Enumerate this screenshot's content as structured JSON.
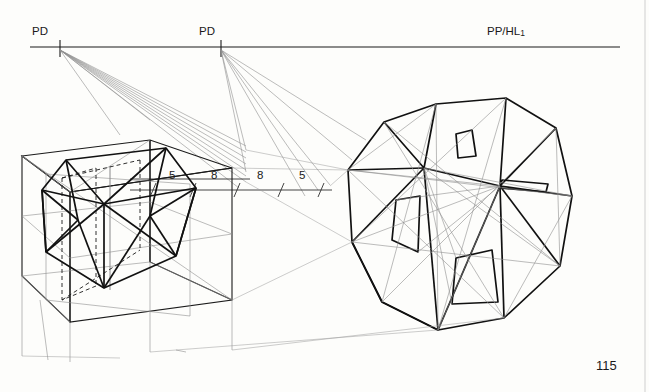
{
  "page": {
    "page_number": "115",
    "background_color": "#fdfdfb",
    "ink_color": "#1a1a1a",
    "construction_color": "#8c8c8c"
  },
  "labels": {
    "pd_left": "PD",
    "pd_right": "PD",
    "picture_plane": "PP/HL",
    "picture_plane_sub": "1",
    "measure_5_left": "5",
    "measure_8_left": "8",
    "measure_8_right": "8",
    "measure_5_right": "5"
  },
  "diagram": {
    "type": "perspective-construction-drawing",
    "horizon_line": {
      "y": 47,
      "x_start": 30,
      "x_end": 620
    },
    "station_points": [
      {
        "name": "PD",
        "x": 60,
        "y": 47
      },
      {
        "name": "PD",
        "x": 221,
        "y": 47
      }
    ],
    "measure_line": {
      "y": 190,
      "x_start": 130,
      "x_end": 330,
      "tick_values": [
        "5",
        "8",
        "8",
        "5"
      ]
    },
    "left_figure": {
      "center_x": 128,
      "center_y": 228,
      "label": "cube-with-inscribed-icosahedron"
    },
    "right_figure": {
      "center_x": 458,
      "center_y": 235,
      "label": "faceted-polyhedron"
    }
  }
}
